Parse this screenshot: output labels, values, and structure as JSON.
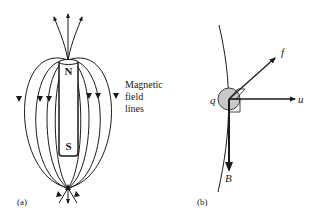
{
  "panel_a": {
    "label": "(a)",
    "north_label": "N",
    "south_label": "S",
    "caption_lines": [
      "Magnetic",
      "field",
      "lines"
    ]
  },
  "panel_b": {
    "label": "(b)",
    "charge_label": "q",
    "force_label": "f",
    "velocity_label": "u",
    "field_label": "B"
  },
  "colors": {
    "ink": "#1a1a1a",
    "charge_fill": "#c8c8c8",
    "background": "#ffffff"
  }
}
